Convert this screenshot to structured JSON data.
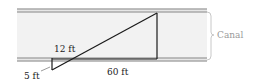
{
  "diagram": {
    "type": "geometry-similar-triangles",
    "labels": {
      "canal": "Canal",
      "small_leg_vertical": "5 ft",
      "small_leg_horizontal": "12 ft",
      "large_leg_horizontal": "60 ft"
    },
    "colors": {
      "canal_fill": "#f2f2f2",
      "bank_line": "#8a8a8a",
      "triangle_stroke": "#1a1a1a",
      "brace": "#c8c8c8",
      "canal_label": "#9a9a9a",
      "text": "#222222"
    }
  }
}
